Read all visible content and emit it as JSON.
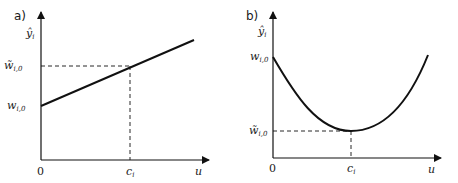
{
  "panels": [
    {
      "id": "a",
      "label": "a)",
      "y_axis_label": "ŷ",
      "y_axis_sub": "i",
      "x_axis_label": "u",
      "origin_label": "0",
      "x_tick_label": "c",
      "x_tick_sub": "i",
      "y_ticks": [
        {
          "main": "w̃",
          "sub": "i,0"
        },
        {
          "main": "w",
          "sub": "i,0"
        }
      ],
      "curve": "linear increasing"
    },
    {
      "id": "b",
      "label": "b)",
      "y_axis_label": "ŷ",
      "y_axis_sub": "i",
      "x_axis_label": "u",
      "origin_label": "0",
      "x_tick_label": "c",
      "x_tick_sub": "i",
      "y_ticks": [
        {
          "main": "w",
          "sub": "i,0"
        },
        {
          "main": "w̃",
          "sub": "i,0"
        }
      ],
      "curve": "parabola with minimum at c_i"
    }
  ],
  "colors": {
    "stroke": "#111111",
    "text": "#1a1a1a",
    "background": "#ffffff"
  }
}
